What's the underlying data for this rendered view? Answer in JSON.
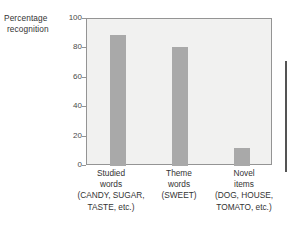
{
  "chart_data": {
    "type": "bar",
    "title": "",
    "subtitle": "",
    "xlabel": "",
    "ylabel": "Percentage recognition",
    "ylabel_lines": [
      "Percentage",
      "recognition"
    ],
    "ylim": [
      0,
      100
    ],
    "yticks": [
      0,
      20,
      40,
      60,
      80,
      100
    ],
    "ytick_labels": [
      "0",
      "20",
      "40",
      "60",
      "80",
      "100"
    ],
    "grid": false,
    "legend": null,
    "categories": [
      "Studied words (CANDY, SUGAR, TASTE, etc.)",
      "Theme words (SWEET)",
      "Novel items (DOG, HOUSE, TOMATO, etc.)"
    ],
    "category_label_lines": [
      [
        "Studied",
        "words",
        "(CANDY, SUGAR,",
        "TASTE, etc.)"
      ],
      [
        "Theme",
        "words",
        "(SWEET)"
      ],
      [
        "Novel",
        "items",
        "(DOG, HOUSE,",
        "TOMATO, etc.)"
      ]
    ],
    "values": [
      89,
      81,
      12
    ],
    "bar_color": "#a9a9a9",
    "plot_background": "#f1f1f0",
    "axis_color": "#949494",
    "text_color": "#333333"
  },
  "decorations": {
    "right_rule_color": "#545454"
  }
}
